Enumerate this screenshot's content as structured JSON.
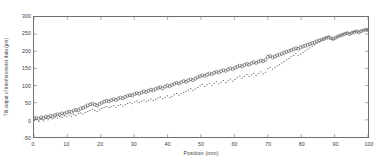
{
  "chart_data": {
    "type": "scatter",
    "title": "",
    "xlabel": "Position (mm)",
    "ylabel": "Tilt output of interferometer data (µm)",
    "xlim": [
      0,
      100
    ],
    "ylim": [
      -50,
      300
    ],
    "xticks": [
      0,
      10,
      20,
      30,
      40,
      50,
      60,
      70,
      80,
      90,
      100
    ],
    "yticks": [
      -50,
      0,
      50,
      100,
      150,
      200,
      250,
      300
    ],
    "xtick_labels": [
      "0",
      "10",
      "20",
      "30",
      "40",
      "50",
      "60",
      "70",
      "80",
      "90",
      "100"
    ],
    "ytick_labels": [
      "-50",
      "0",
      "50",
      "100",
      "150",
      "200",
      "250",
      "300"
    ],
    "grid": false,
    "legend_position": "none",
    "marker_color": "#444444",
    "axis_color": "#6e6e6e",
    "series": [
      {
        "name": "Interferometer output",
        "marker": "open-circle",
        "x": [
          0,
          0.7,
          1.4,
          2.1,
          2.8,
          3.5,
          4.2,
          4.9,
          5.6,
          6.3,
          7.0,
          7.7,
          8.4,
          9.1,
          9.8,
          10.5,
          11.2,
          11.9,
          12.6,
          13.3,
          14.0,
          14.7,
          15.4,
          16.1,
          16.8,
          17.5,
          18.2,
          18.9,
          19.6,
          20.3,
          21.0,
          21.7,
          22.4,
          23.1,
          23.8,
          24.5,
          25.2,
          25.9,
          26.6,
          27.3,
          28.0,
          28.7,
          29.4,
          30.1,
          30.8,
          31.5,
          32.2,
          32.9,
          33.6,
          34.3,
          35.0,
          35.7,
          36.4,
          37.1,
          37.8,
          38.5,
          39.2,
          39.9,
          40.6,
          41.3,
          42.0,
          42.7,
          43.4,
          44.1,
          44.8,
          45.5,
          46.2,
          46.9,
          47.6,
          48.3,
          49.0,
          49.7,
          50.4,
          51.1,
          51.8,
          52.5,
          53.2,
          53.9,
          54.6,
          55.3,
          56.0,
          56.7,
          57.4,
          58.1,
          58.8,
          59.5,
          60.2,
          60.9,
          61.6,
          62.3,
          63.0,
          63.7,
          64.4,
          65.1,
          65.8,
          66.5,
          67.2,
          67.9,
          68.6,
          69.3,
          70.0,
          70.7,
          71.4,
          72.1,
          72.8,
          73.5,
          74.2,
          74.9,
          75.6,
          76.3,
          77.0,
          77.7,
          78.4,
          79.1,
          79.8,
          80.5,
          81.2,
          81.9,
          82.6,
          83.3,
          84.0,
          84.7,
          85.4,
          86.1,
          86.8,
          87.5,
          88.2,
          88.9,
          89.6,
          90.3,
          91.0,
          91.7,
          92.4,
          93.1,
          93.8,
          94.5,
          95.2,
          95.9,
          96.6,
          97.3,
          98.0,
          98.7,
          99.4,
          100.0
        ],
        "y": [
          4,
          6,
          3,
          7,
          5,
          9,
          8,
          12,
          10,
          14,
          16,
          15,
          19,
          18,
          22,
          24,
          23,
          27,
          29,
          28,
          33,
          35,
          38,
          42,
          45,
          47,
          44,
          42,
          46,
          50,
          53,
          56,
          54,
          57,
          60,
          58,
          62,
          65,
          63,
          67,
          70,
          72,
          71,
          75,
          78,
          76,
          80,
          83,
          81,
          85,
          88,
          86,
          90,
          93,
          95,
          92,
          97,
          100,
          98,
          102,
          105,
          108,
          106,
          110,
          113,
          111,
          115,
          118,
          116,
          120,
          124,
          127,
          130,
          128,
          132,
          135,
          133,
          137,
          140,
          138,
          142,
          145,
          143,
          147,
          150,
          148,
          152,
          155,
          158,
          156,
          160,
          163,
          161,
          165,
          168,
          166,
          170,
          173,
          171,
          175,
          184,
          186,
          182,
          185,
          188,
          190,
          193,
          196,
          198,
          201,
          203,
          206,
          209,
          207,
          211,
          214,
          216,
          219,
          221,
          224,
          226,
          229,
          231,
          234,
          236,
          239,
          241,
          238,
          236,
          240,
          243,
          246,
          248,
          251,
          253,
          250,
          254,
          256,
          258,
          255,
          259,
          261,
          263,
          262
        ]
      },
      {
        "name": "Reference data",
        "marker": "dot",
        "x": [
          0,
          0.7,
          1.4,
          2.1,
          2.8,
          3.5,
          4.2,
          4.9,
          5.6,
          6.3,
          7.0,
          7.7,
          8.4,
          9.1,
          9.8,
          10.5,
          11.2,
          11.9,
          12.6,
          13.3,
          14.0,
          14.7,
          15.4,
          16.1,
          16.8,
          17.5,
          18.2,
          18.9,
          19.6,
          20.3,
          21.0,
          21.7,
          22.4,
          23.1,
          23.8,
          24.5,
          25.2,
          25.9,
          26.6,
          27.3,
          28.0,
          28.7,
          29.4,
          30.1,
          30.8,
          31.5,
          32.2,
          32.9,
          33.6,
          34.3,
          35.0,
          35.7,
          36.4,
          37.1,
          37.8,
          38.5,
          39.2,
          39.9,
          40.6,
          41.3,
          42.0,
          42.7,
          43.4,
          44.1,
          44.8,
          45.5,
          46.2,
          46.9,
          47.6,
          48.3,
          49.0,
          49.7,
          50.4,
          51.1,
          51.8,
          52.5,
          53.2,
          53.9,
          54.6,
          55.3,
          56.0,
          56.7,
          57.4,
          58.1,
          58.8,
          59.5,
          60.2,
          60.9,
          61.6,
          62.3,
          63.0,
          63.7,
          64.4,
          65.1,
          65.8,
          66.5,
          67.2,
          67.9,
          68.6,
          69.3,
          70.0,
          70.7,
          71.4,
          72.1,
          72.8,
          73.5,
          74.2,
          74.9,
          75.6,
          76.3,
          77.0,
          77.7,
          78.4,
          79.1,
          79.8,
          80.5,
          81.2,
          81.9,
          82.6,
          83.3,
          84.0,
          84.7,
          85.4,
          86.1,
          86.8,
          87.5,
          88.2,
          88.9,
          89.6,
          90.3,
          91.0,
          91.7,
          92.4,
          93.1,
          93.8,
          94.5,
          95.2,
          95.9,
          96.6,
          97.3,
          98.0,
          98.7,
          99.4,
          100.0
        ],
        "y": [
          -2,
          1,
          -5,
          2,
          -3,
          4,
          0,
          6,
          3,
          8,
          5,
          10,
          7,
          12,
          9,
          14,
          11,
          16,
          13,
          18,
          20,
          17,
          22,
          25,
          28,
          31,
          27,
          24,
          29,
          33,
          36,
          39,
          35,
          38,
          41,
          37,
          42,
          45,
          40,
          44,
          48,
          51,
          47,
          52,
          55,
          50,
          54,
          58,
          53,
          57,
          61,
          56,
          60,
          64,
          67,
          62,
          66,
          70,
          65,
          69,
          73,
          77,
          72,
          76,
          80,
          83,
          87,
          91,
          86,
          90,
          95,
          99,
          103,
          98,
          102,
          107,
          101,
          106,
          111,
          105,
          110,
          115,
          109,
          114,
          119,
          113,
          118,
          123,
          128,
          122,
          127,
          132,
          126,
          131,
          136,
          130,
          135,
          140,
          134,
          139,
          150,
          153,
          148,
          152,
          157,
          161,
          166,
          170,
          175,
          179,
          184,
          188,
          193,
          187,
          192,
          197,
          201,
          206,
          210,
          215,
          219,
          224,
          228,
          233,
          236,
          240,
          243,
          237,
          234,
          239,
          243,
          246,
          249,
          252,
          254,
          251,
          255,
          257,
          259,
          256,
          260,
          262,
          264,
          262
        ]
      }
    ]
  }
}
